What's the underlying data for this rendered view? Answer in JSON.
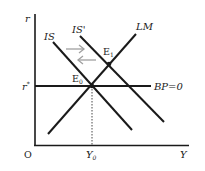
{
  "diagram": {
    "type": "IS-LM-BP",
    "axes": {
      "y_label": "r",
      "x_label": "Y",
      "origin_label": "O"
    },
    "curves": {
      "is": "IS",
      "is_prime": "IS'",
      "lm": "LM",
      "bp": "BP=0"
    },
    "points": {
      "e0": {
        "main": "E",
        "sub": "0"
      },
      "e1": {
        "main": "E",
        "sub": "1"
      }
    },
    "ticks": {
      "r_star": {
        "main": "r",
        "sup": "*"
      },
      "y0": {
        "main": "Y",
        "sub": "0"
      }
    },
    "arrows": {
      "right": "shift right",
      "left": "shift left"
    },
    "colors": {
      "line": "#1a1a1a",
      "arrow": "#a0a0a0",
      "background": "#ffffff"
    }
  }
}
